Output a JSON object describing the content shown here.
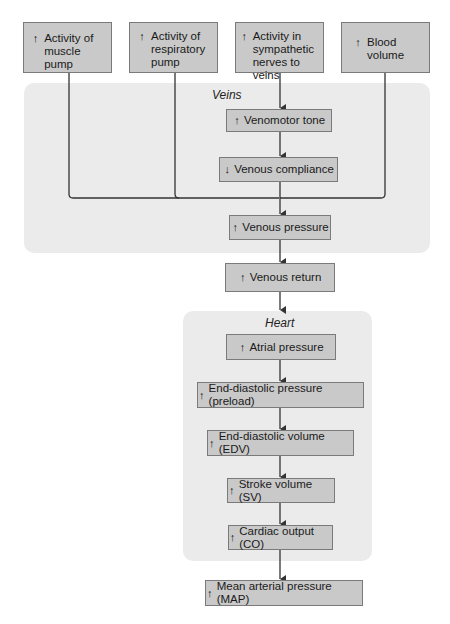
{
  "colors": {
    "box_fill": "#c9c9c9",
    "box_border": "#7a7a7a",
    "region_fill": "#ebebeb",
    "line": "#333333"
  },
  "inputs": [
    {
      "direction": "up",
      "icon": "↑",
      "label": "Activity of\nmuscle pump"
    },
    {
      "direction": "up",
      "icon": "↑",
      "label": "Activity of\nrespiratory\npump"
    },
    {
      "direction": "up",
      "icon": "↑",
      "label": "Activity in\nsympathetic\nnerves to veins"
    },
    {
      "direction": "up",
      "icon": "↑",
      "label": "Blood\nvolume"
    }
  ],
  "veins": {
    "label": "Veins",
    "nodes": [
      {
        "direction": "up",
        "icon": "↑",
        "label": "Venomotor tone"
      },
      {
        "direction": "down",
        "icon": "↓",
        "label": "Venous compliance"
      },
      {
        "direction": "up",
        "icon": "↑",
        "label": "Venous pressure"
      }
    ]
  },
  "venous_return": {
    "direction": "up",
    "icon": "↑",
    "label": "Venous return"
  },
  "heart": {
    "label": "Heart",
    "nodes": [
      {
        "direction": "up",
        "icon": "↑",
        "label": "Atrial pressure"
      },
      {
        "direction": "up",
        "icon": "↑",
        "label": "End-diastolic pressure (preload)"
      },
      {
        "direction": "up",
        "icon": "↑",
        "label": "End-diastolic volume (EDV)"
      },
      {
        "direction": "up",
        "icon": "↑",
        "label": "Stroke volume (SV)"
      },
      {
        "direction": "up",
        "icon": "↑",
        "label": "Cardiac output (CO)"
      }
    ]
  },
  "output": {
    "direction": "up",
    "icon": "↑",
    "label": "Mean arterial pressure (MAP)"
  }
}
